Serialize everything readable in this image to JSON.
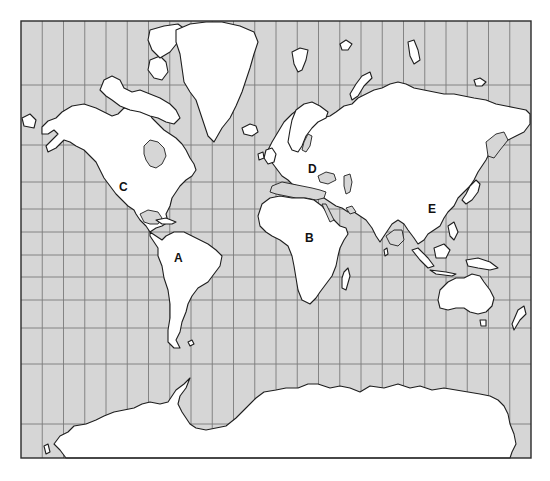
{
  "map": {
    "type": "world map",
    "projection": "Mercator",
    "colors": {
      "ocean": "#d6d6d6",
      "land": "#ffffff",
      "outline": "#1e1e1e",
      "grid": "#7a7a7a"
    },
    "frame": {
      "left": 21,
      "top": 21,
      "right": 531,
      "bottom": 458
    },
    "grid": {
      "meridian_count": 24,
      "parallel_positions_px": [
        85,
        145,
        182,
        209,
        232,
        255,
        277,
        300,
        328,
        364,
        424
      ]
    },
    "labels": [
      {
        "id": "A",
        "text": "A",
        "region": "South America",
        "x": 174,
        "y": 252
      },
      {
        "id": "B",
        "text": "B",
        "region": "Africa",
        "x": 305,
        "y": 232
      },
      {
        "id": "C",
        "text": "C",
        "region": "North America",
        "x": 119,
        "y": 181
      },
      {
        "id": "D",
        "text": "D",
        "region": "Europe",
        "x": 308,
        "y": 163
      },
      {
        "id": "E",
        "text": "E",
        "region": "Asia",
        "x": 428,
        "y": 203
      }
    ]
  }
}
